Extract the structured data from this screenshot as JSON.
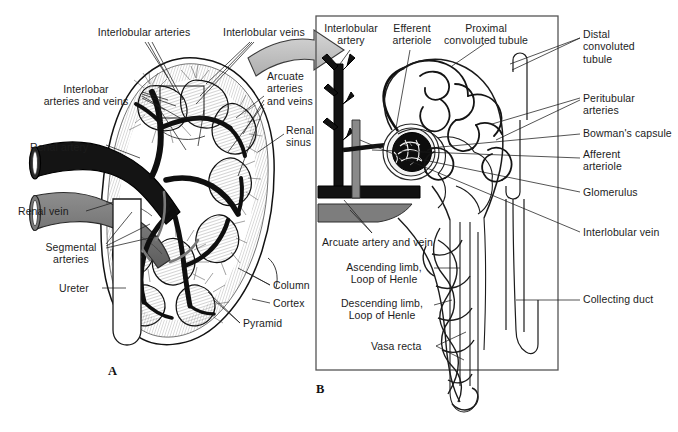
{
  "figure": {
    "panels": [
      {
        "letter": "A",
        "name": "kidney-coronal-section"
      },
      {
        "letter": "B",
        "name": "nephron-detail"
      }
    ]
  },
  "colors": {
    "artery_dark": "#1b1b1b",
    "vein_gray": "#6f6f6f",
    "vein_light": "#8d8d8d",
    "outline": "#111111",
    "hatch": "#5a5a5a",
    "arrow_fill": "#c9c9c9",
    "panel_border": "#555555",
    "background": "#ffffff",
    "text": "#1c1c1c"
  },
  "panelA": {
    "letter": "A",
    "labels": [
      {
        "id": "interlobular-arteries",
        "text": "Interlobular arteries",
        "x": 84,
        "y": 26,
        "align": "c",
        "w": 120
      },
      {
        "id": "interlobular-veins",
        "text": "Interlobular veins",
        "x": 212,
        "y": 26,
        "align": "c",
        "w": 104
      },
      {
        "id": "interlobar-arteries-and-veins",
        "text": "Interlobar\narteries and veins",
        "x": 33,
        "y": 83,
        "align": "c",
        "w": 106
      },
      {
        "id": "arcuate-arteries-and-veins",
        "text": "Arcuate\narteries\nand veins",
        "x": 267,
        "y": 70,
        "align": "l",
        "w": 56
      },
      {
        "id": "renal-sinus",
        "text": "Renal\nsinus",
        "x": 286,
        "y": 124,
        "align": "l",
        "w": 42
      },
      {
        "id": "renal-artery",
        "text": "Renal artery",
        "x": 30,
        "y": 141,
        "align": "l",
        "w": 70
      },
      {
        "id": "renal-vein",
        "text": "Renal vein",
        "x": 18,
        "y": 208,
        "align": "l",
        "w": 62
      },
      {
        "id": "segmental-arteries",
        "text": "Segmental\narteries",
        "x": 38,
        "y": 247,
        "align": "c",
        "w": 66
      },
      {
        "id": "ureter",
        "text": "Ureter",
        "x": 59,
        "y": 283,
        "align": "l",
        "w": 40
      },
      {
        "id": "column",
        "text": "Column",
        "x": 273,
        "y": 282,
        "align": "l",
        "w": 48
      },
      {
        "id": "cortex",
        "text": "Cortex",
        "x": 273,
        "y": 300,
        "align": "l",
        "w": 44
      },
      {
        "id": "pyramid",
        "text": "Pyramid",
        "x": 243,
        "y": 320,
        "align": "l",
        "w": 52
      }
    ]
  },
  "panelB": {
    "letter": "B",
    "border": {
      "x": 316,
      "y": 16,
      "w": 242,
      "h": 354
    },
    "labels": [
      {
        "id": "interlobular-artery",
        "text": "Interlobular\nartery",
        "x": 320,
        "y": 22,
        "align": "c",
        "w": 62
      },
      {
        "id": "efferent-arteriole",
        "text": "Efferent\narteriole",
        "x": 386,
        "y": 22,
        "align": "c",
        "w": 52
      },
      {
        "id": "proximal-convoluted-tubule",
        "text": "Proximal\nconvoluted tubule",
        "x": 438,
        "y": 22,
        "align": "c",
        "w": 96
      },
      {
        "id": "distal-convoluted-tubule",
        "text": "Distal\nconvoluted\ntubule",
        "x": 583,
        "y": 28,
        "align": "l",
        "w": 70
      },
      {
        "id": "peritubular-arteries",
        "text": "Peritubular\narteries",
        "x": 583,
        "y": 92,
        "align": "l",
        "w": 70
      },
      {
        "id": "bowmans-capsule",
        "text": "Bowman's capsule",
        "x": 583,
        "y": 131,
        "align": "l",
        "w": 96
      },
      {
        "id": "afferent-arteriole",
        "text": "Afferent\narteriole",
        "x": 583,
        "y": 152,
        "align": "l",
        "w": 60
      },
      {
        "id": "glomerulus",
        "text": "Glomerulus",
        "x": 583,
        "y": 189,
        "align": "l",
        "w": 70
      },
      {
        "id": "interlobular-vein",
        "text": "Interlobular vein",
        "x": 583,
        "y": 229,
        "align": "l",
        "w": 90
      },
      {
        "id": "collecting-duct",
        "text": "Collecting duct",
        "x": 583,
        "y": 296,
        "align": "l",
        "w": 86
      },
      {
        "id": "arcuate-artery-and-vein",
        "text": "Arcuate artery and vein",
        "x": 322,
        "y": 239,
        "align": "l",
        "w": 128
      },
      {
        "id": "ascending-limb-loop-of-henle",
        "text": "Ascending limb,\nLoop of Henle",
        "x": 338,
        "y": 264,
        "align": "c",
        "w": 92
      },
      {
        "id": "descending-limb-loop-of-henle",
        "text": "Descending limb,\nLoop of Henle",
        "x": 333,
        "y": 300,
        "align": "c",
        "w": 98
      },
      {
        "id": "vasa-recta",
        "text": "Vasa recta",
        "x": 371,
        "y": 343,
        "align": "l",
        "w": 62
      }
    ]
  }
}
